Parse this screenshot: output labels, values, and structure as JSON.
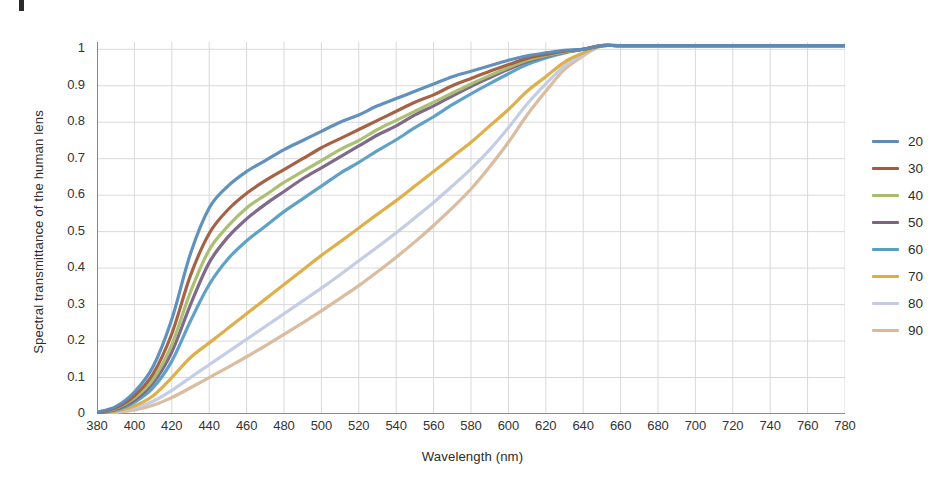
{
  "figure": {
    "artifact_label": ""
  },
  "axes": {
    "x_title": "Wavelength (nm)",
    "y_title": "Spectral transmittance of the human lens",
    "x_ticks": [
      380,
      400,
      420,
      440,
      460,
      480,
      500,
      520,
      540,
      560,
      580,
      600,
      620,
      640,
      660,
      680,
      700,
      720,
      740,
      760,
      780
    ],
    "y_ticks": [
      "0",
      "0.1",
      "0.2",
      "0.3",
      "0.4",
      "0.5",
      "0.6",
      "0.7",
      "0.8",
      "0.9",
      "1"
    ]
  },
  "legend": {
    "position": "right",
    "entries": [
      {
        "label": "20",
        "color": "#5b8cba"
      },
      {
        "label": "30",
        "color": "#a15c3e"
      },
      {
        "label": "40",
        "color": "#a8bd6c"
      },
      {
        "label": "50",
        "color": "#7a6484"
      },
      {
        "label": "60",
        "color": "#5a9ec4"
      },
      {
        "label": "70",
        "color": "#ddad45"
      },
      {
        "label": "80",
        "color": "#c2cbe3"
      },
      {
        "label": "90",
        "color": "#d8b99b"
      }
    ]
  },
  "chart_data": {
    "type": "line",
    "title": "",
    "xlabel": "Wavelength (nm)",
    "ylabel": "Spectral transmittance of the human lens",
    "xlim": [
      380,
      780
    ],
    "ylim": [
      0,
      1.02
    ],
    "grid": true,
    "legend_position": "right",
    "legend_title": "Age (years)",
    "x": [
      380,
      390,
      400,
      410,
      420,
      430,
      440,
      450,
      460,
      470,
      480,
      490,
      500,
      510,
      520,
      530,
      540,
      550,
      560,
      570,
      580,
      590,
      600,
      610,
      620,
      630,
      640,
      650,
      660,
      680,
      700,
      720,
      740,
      760,
      780
    ],
    "series": [
      {
        "name": "20",
        "color": "#5b8cba",
        "values": [
          0.005,
          0.02,
          0.06,
          0.13,
          0.26,
          0.44,
          0.565,
          0.625,
          0.665,
          0.695,
          0.725,
          0.75,
          0.775,
          0.8,
          0.82,
          0.845,
          0.865,
          0.885,
          0.905,
          0.925,
          0.94,
          0.955,
          0.97,
          0.982,
          0.99,
          0.997,
          1.0,
          1.01,
          1.01,
          1.01,
          1.01,
          1.01,
          1.01,
          1.01,
          1.01
        ]
      },
      {
        "name": "30",
        "color": "#a15c3e",
        "values": [
          0.004,
          0.017,
          0.05,
          0.11,
          0.22,
          0.38,
          0.495,
          0.56,
          0.605,
          0.64,
          0.67,
          0.7,
          0.73,
          0.755,
          0.78,
          0.805,
          0.83,
          0.855,
          0.875,
          0.9,
          0.92,
          0.94,
          0.958,
          0.975,
          0.986,
          0.995,
          1.0,
          1.01,
          1.01,
          1.01,
          1.01,
          1.01,
          1.01,
          1.01,
          1.01
        ]
      },
      {
        "name": "40",
        "color": "#a8bd6c",
        "values": [
          0.004,
          0.015,
          0.044,
          0.095,
          0.19,
          0.335,
          0.45,
          0.515,
          0.565,
          0.6,
          0.635,
          0.665,
          0.695,
          0.725,
          0.75,
          0.78,
          0.805,
          0.83,
          0.855,
          0.88,
          0.905,
          0.928,
          0.95,
          0.97,
          0.983,
          0.993,
          1.0,
          1.01,
          1.01,
          1.01,
          1.01,
          1.01,
          1.01,
          1.01,
          1.01
        ]
      },
      {
        "name": "50",
        "color": "#7a6484",
        "values": [
          0.003,
          0.013,
          0.038,
          0.085,
          0.17,
          0.3,
          0.415,
          0.485,
          0.535,
          0.575,
          0.61,
          0.645,
          0.675,
          0.705,
          0.735,
          0.765,
          0.79,
          0.82,
          0.845,
          0.872,
          0.898,
          0.922,
          0.945,
          0.966,
          0.981,
          0.992,
          1.0,
          1.01,
          1.01,
          1.01,
          1.01,
          1.01,
          1.01,
          1.01,
          1.01
        ]
      },
      {
        "name": "60",
        "color": "#5a9ec4",
        "values": [
          0.003,
          0.011,
          0.032,
          0.072,
          0.145,
          0.255,
          0.355,
          0.425,
          0.475,
          0.515,
          0.555,
          0.59,
          0.625,
          0.66,
          0.69,
          0.722,
          0.752,
          0.785,
          0.815,
          0.848,
          0.878,
          0.906,
          0.933,
          0.958,
          0.976,
          0.99,
          1.0,
          1.01,
          1.01,
          1.01,
          1.01,
          1.01,
          1.01,
          1.01,
          1.01
        ]
      },
      {
        "name": "70",
        "color": "#ddad45",
        "values": [
          0.002,
          0.008,
          0.022,
          0.05,
          0.1,
          0.155,
          0.195,
          0.235,
          0.275,
          0.315,
          0.355,
          0.395,
          0.435,
          0.472,
          0.51,
          0.548,
          0.585,
          0.625,
          0.665,
          0.705,
          0.745,
          0.79,
          0.835,
          0.885,
          0.925,
          0.965,
          0.99,
          1.01,
          1.01,
          1.01,
          1.01,
          1.01,
          1.01,
          1.01,
          1.01
        ]
      },
      {
        "name": "80",
        "color": "#c2cbe3",
        "values": [
          0.002,
          0.006,
          0.016,
          0.035,
          0.065,
          0.1,
          0.135,
          0.17,
          0.205,
          0.24,
          0.275,
          0.31,
          0.345,
          0.382,
          0.42,
          0.458,
          0.497,
          0.538,
          0.58,
          0.625,
          0.672,
          0.725,
          0.785,
          0.85,
          0.905,
          0.955,
          0.985,
          1.01,
          1.01,
          1.01,
          1.01,
          1.01,
          1.01,
          1.01,
          1.01
        ]
      },
      {
        "name": "90",
        "color": "#d8b99b",
        "values": [
          0.001,
          0.004,
          0.011,
          0.024,
          0.045,
          0.072,
          0.1,
          0.128,
          0.157,
          0.187,
          0.218,
          0.25,
          0.283,
          0.317,
          0.352,
          0.39,
          0.43,
          0.472,
          0.517,
          0.565,
          0.617,
          0.678,
          0.745,
          0.82,
          0.885,
          0.945,
          0.982,
          1.01,
          1.01,
          1.01,
          1.01,
          1.01,
          1.01,
          1.01,
          1.01
        ]
      }
    ]
  }
}
